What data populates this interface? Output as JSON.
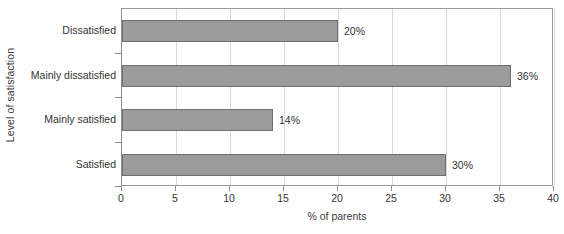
{
  "chart_data": {
    "type": "bar",
    "orientation": "horizontal",
    "title": "",
    "categories": [
      "Dissatisfied",
      "Mainly dissatisfied",
      "Mainly satisfied",
      "Satisfied"
    ],
    "values": [
      20,
      36,
      14,
      30
    ],
    "data_labels": [
      "20%",
      "36%",
      "14%",
      "30%"
    ],
    "xlabel": "% of parents",
    "ylabel": "Level of satisfaction",
    "xlim": [
      0,
      40
    ],
    "xticks": [
      0,
      5,
      10,
      15,
      20,
      25,
      30,
      35,
      40
    ],
    "xtick_labels": [
      "0",
      "5",
      "10",
      "15",
      "20",
      "25",
      "30",
      "35",
      "40"
    ],
    "grid": "vertical",
    "legend": "none",
    "bar_color": "#9b9b9b",
    "bar_border_color": "#6f6f6f",
    "gridline_color": "#d9d9d9",
    "axis_color": "#8e8e8e"
  }
}
